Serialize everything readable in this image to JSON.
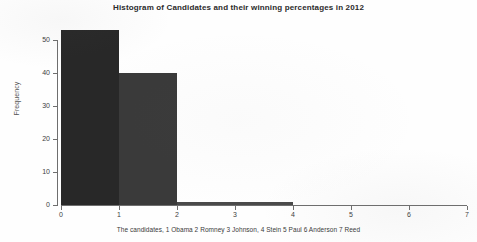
{
  "figure": {
    "title": "Histogram of Candidates and their winning percentages in 2012",
    "caption": "The candidates, 1  Obama 2 Romney 3 Johnson, 4 Stein 5 Paul 6 Anderson 7 Reed",
    "background_color": "#ffffff"
  },
  "chart_data": {
    "type": "bar",
    "title": "Histogram of Candidates and their winning percentages in 2012",
    "subtitle": "",
    "xlabel": "The candidates, 1  Obama 2 Romney 3 Johnson, 4 Stein 5 Paul 6 Anderson 7 Reed",
    "ylabel": "Frequency",
    "xlim": [
      0,
      7
    ],
    "ylim": [
      0,
      55
    ],
    "grid": false,
    "legend": null,
    "bin_width": 1,
    "bin_edges": [
      0,
      1,
      2,
      3,
      4,
      5,
      6,
      7
    ],
    "categories": [
      "0-1",
      "1-2",
      "2-3",
      "3-4",
      "4-5",
      "5-6",
      "6-7"
    ],
    "values": [
      53,
      40,
      1,
      1,
      0,
      0,
      0
    ],
    "bar_colors": [
      "#282828",
      "#3a3a3a",
      "#4a4a4a",
      "#4a4a4a",
      "#4a4a4a",
      "#4a4a4a",
      "#4a4a4a"
    ],
    "xticks": [
      0,
      1,
      2,
      3,
      4,
      5,
      6,
      7
    ],
    "xticklabels": [
      "0",
      "1",
      "2",
      "3",
      "4",
      "5",
      "6",
      "7"
    ],
    "yticks": [
      0,
      10,
      20,
      30,
      40,
      50
    ],
    "yticklabels": [
      "0",
      "10",
      "20",
      "30",
      "40",
      "50"
    ]
  }
}
